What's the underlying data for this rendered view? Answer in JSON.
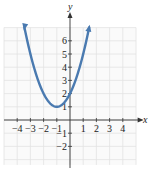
{
  "chart_data": {
    "type": "line",
    "title": "",
    "xlabel": "x",
    "ylabel": "y",
    "xlim": [
      -5,
      5
    ],
    "ylim": [
      -3,
      7
    ],
    "grid": true,
    "x_ticks": [
      -4,
      -3,
      -2,
      -1,
      1,
      2,
      3,
      4
    ],
    "y_ticks": [
      -2,
      -1,
      1,
      2,
      3,
      4,
      5,
      6
    ],
    "x_tick_labels": [
      "−4",
      "−3",
      "−2",
      "−1",
      "1",
      "2",
      "3",
      "4"
    ],
    "y_tick_labels": [
      "−2",
      "−1",
      "1",
      "2",
      "3",
      "4",
      "5",
      "6"
    ],
    "series": [
      {
        "name": "y = x² + 2x + 2",
        "equation": "y = (x + 1)^2 + 1",
        "vertex": [
          -1,
          1
        ],
        "y_intercept": [
          0,
          2
        ],
        "color": "#4a7ab0",
        "arrows": "both ends",
        "x": [
          -3.6,
          -3,
          -2,
          -1,
          0,
          1,
          1.6
        ],
        "y": [
          7.76,
          5,
          2,
          1,
          2,
          5,
          7.76
        ]
      }
    ]
  },
  "colors": {
    "curve": "#4a7ab0",
    "grid": "#e2e2e2",
    "axis": "#333333"
  }
}
